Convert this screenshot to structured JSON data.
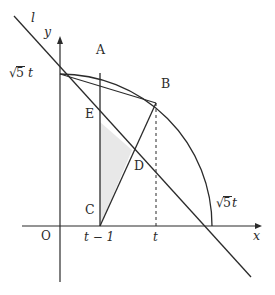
{
  "figure": {
    "background_color": "#ffffff",
    "stroke_color": "#2b2b2b",
    "shade_color": "#e8e8e8"
  },
  "axes": {
    "x_label": "x",
    "y_label": "y",
    "origin_label": "O",
    "origin_px": {
      "x": 60,
      "y": 226
    },
    "x_axis": {
      "x1": 22,
      "y1": 226,
      "x2": 262,
      "y2": 226
    },
    "y_axis": {
      "x1": 60,
      "y1": 282,
      "x2": 60,
      "y2": 38
    }
  },
  "line": {
    "name_label": "l",
    "from_px": {
      "x": 14,
      "y": 16
    },
    "to_px": {
      "x": 251,
      "y": 277
    }
  },
  "arc": {
    "center_px": {
      "x": 60,
      "y": 226
    },
    "radius_px": 152,
    "start_px": {
      "x": 60,
      "y": 74
    },
    "end_px": {
      "x": 212,
      "y": 226
    }
  },
  "points": [
    {
      "label": "A",
      "px": {
        "x": 100,
        "y": 73
      },
      "label_px": {
        "x": 96,
        "y": 49
      }
    },
    {
      "label": "B",
      "px": {
        "x": 156,
        "y": 103
      },
      "label_px": {
        "x": 161,
        "y": 83
      }
    },
    {
      "label": "C",
      "px": {
        "x": 100,
        "y": 226
      },
      "label_px": {
        "x": 86,
        "y": 209
      }
    },
    {
      "label": "D",
      "px": {
        "x": 132,
        "y": 150
      },
      "label_px": {
        "x": 134,
        "y": 165
      }
    },
    {
      "label": "E",
      "px": {
        "x": 100,
        "y": 122
      },
      "label_px": {
        "x": 86,
        "y": 112
      }
    }
  ],
  "labels": {
    "radius_y_axis": {
      "sqrt_sign": "√",
      "radicand": "5",
      "variable": "t",
      "px": {
        "x": 10,
        "y": 68
      }
    },
    "radius_x_axis": {
      "sqrt_sign": "√",
      "radicand": "5",
      "variable": "t",
      "px": {
        "x": 216,
        "y": 198
      }
    },
    "tick_t_minus_1": {
      "text": "t − 1",
      "px": {
        "x": 100,
        "y": 234
      }
    },
    "tick_t": {
      "text": "t",
      "px": {
        "x": 156,
        "y": 234
      }
    }
  },
  "shaded_region": {
    "name": "triangle-E-C-D",
    "vertices": [
      {
        "label": "E",
        "x": 100,
        "y": 122
      },
      {
        "label": "C",
        "x": 100,
        "y": 226
      },
      {
        "label": "D",
        "x": 132,
        "y": 150
      }
    ]
  },
  "segments": [
    {
      "name": "segment-A-C",
      "x1": 100,
      "y1": 73,
      "x2": 100,
      "y2": 226
    },
    {
      "name": "segment-C-B",
      "x1": 100,
      "y1": 226,
      "x2": 156,
      "y2": 103
    },
    {
      "name": "chord-top-to-B",
      "x1": 60,
      "y1": 74,
      "x2": 156,
      "y2": 103
    }
  ],
  "dashed_segments": [
    {
      "name": "dashed-B-to-x-axis",
      "x1": 156,
      "y1": 103,
      "x2": 156,
      "y2": 226
    }
  ]
}
